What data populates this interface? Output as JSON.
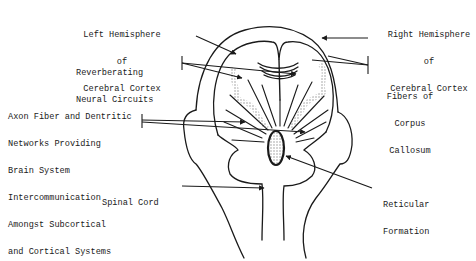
{
  "diagram": {
    "type": "anatomical line drawing",
    "colors": {
      "ink": "#1a1a1a",
      "stipple": "#9a9a9a",
      "background": "#ffffff"
    },
    "labels": {
      "left_hemisphere": {
        "lines": [
          "Left Hemisphere",
          "of",
          "Cerebral Cortex"
        ]
      },
      "right_hemisphere": {
        "lines": [
          "Right Hemisphere",
          "of",
          "Cerebral Cortex"
        ]
      },
      "reverberating": {
        "lines": [
          "Reverberating",
          "Neural Circuits"
        ]
      },
      "corpus_callosum": {
        "lines": [
          "Fibers of",
          "Corpus",
          "Callosum"
        ]
      },
      "axon_fiber": {
        "lines": [
          "Axon Fiber and Dentritic",
          "Networks Providing",
          "Brain System",
          "Intercommunication",
          "Amongst Subcortical",
          "and Cortical Systems"
        ]
      },
      "spinal_cord": {
        "lines": [
          "Spinal Cord"
        ]
      },
      "reticular": {
        "lines": [
          "Reticular",
          "Formation"
        ]
      }
    }
  }
}
